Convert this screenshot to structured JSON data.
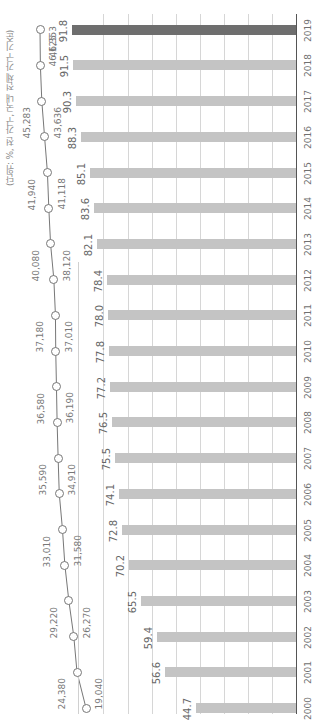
{
  "chart_data": {
    "type": "bar+line",
    "orientation": "rotated-90",
    "unit_label": "(단위: %, 천 가구, 국내 전체 가구 기준)",
    "categories": [
      "2000",
      "2001",
      "2002",
      "2003",
      "2004",
      "2005",
      "2006",
      "2007",
      "2008",
      "2009",
      "2010",
      "2011",
      "2012",
      "2013",
      "2014",
      "2015",
      "2016",
      "2017",
      "2018",
      "2019"
    ],
    "series": [
      {
        "name": "percentage",
        "type": "bar",
        "unit": "%",
        "values": [
          44.7,
          56.6,
          59.4,
          65.5,
          70.2,
          72.8,
          74.1,
          75.5,
          76.5,
          77.2,
          77.8,
          78.0,
          78.4,
          82.1,
          83.6,
          85.1,
          88.3,
          90.3,
          91.5,
          91.8
        ],
        "labels": [
          "44.7",
          "56.6",
          "59.4",
          "65.5",
          "70.2",
          "72.8",
          "74.1",
          "75.5",
          "76.5",
          "77.2",
          "77.8",
          "78.0",
          "78.4",
          "82.1",
          "83.6",
          "85.1",
          "88.3",
          "90.3",
          "91.5",
          "91.8"
        ],
        "color": "#c4c4c4",
        "highlight_color": "#6e6e6e",
        "highlight_index": 19
      },
      {
        "name": "households",
        "type": "line",
        "unit": "천 가구",
        "values": [
          19040,
          24380,
          26270,
          29220,
          31580,
          33010,
          34910,
          35590,
          36190,
          36580,
          37010,
          37180,
          38120,
          40080,
          41118,
          41940,
          43636,
          45283,
          46125,
          46353
        ],
        "labels": [
          "19,040",
          "24,380",
          "26,270",
          "29,220",
          "31,580",
          "33,010",
          "34,910",
          "35,590",
          "36,190",
          "36,580",
          "37,010",
          "37,180",
          "38,120",
          "40,080",
          "41,118",
          "41,940",
          "43,636",
          "45,283",
          "46,125",
          "46,353"
        ],
        "color": "#777777"
      }
    ],
    "grid": true,
    "legend": "none"
  },
  "source_note": ""
}
